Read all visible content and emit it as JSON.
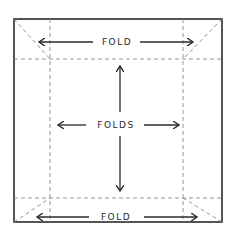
{
  "diagram": {
    "labels": {
      "top": "FOLD",
      "center": "FOLDS",
      "bottom": "FOLD"
    },
    "colors": {
      "stroke": "#2a2a2a",
      "dashed": "#888888",
      "background": "#ffffff"
    }
  }
}
